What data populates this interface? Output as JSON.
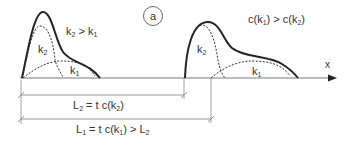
{
  "figure": {
    "panel_label": "a",
    "axis_label": "x",
    "colors": {
      "line": "#222222",
      "axis": "#7a7a7a",
      "text": "#333333"
    },
    "left_pulse": {
      "condition": {
        "k_a": "k",
        "sub_a": "2",
        "op": " > ",
        "k_b": "k",
        "sub_b": "1"
      },
      "k2_label": {
        "k": "k",
        "sub": "2"
      },
      "k1_label": {
        "k": "k",
        "sub": "1"
      }
    },
    "right_pulse": {
      "condition": {
        "pre_a": "c(k",
        "sub_a": "1",
        "mid": ") > c(k",
        "sub_b": "2",
        "post": ")"
      },
      "k2_label": {
        "k": "k",
        "sub": "2"
      },
      "k1_label": {
        "k": "k",
        "sub": "1"
      }
    },
    "dimensions": {
      "L2": {
        "L": "L",
        "L_sub": "2",
        "eq": " = t  c(k",
        "k_sub": "2",
        "post": ")"
      },
      "L1": {
        "L": "L",
        "L_sub": "1",
        "eq": " = t  c(k",
        "k_sub": "1",
        "post": ")  >  L",
        "tail_sub": "2"
      }
    }
  }
}
